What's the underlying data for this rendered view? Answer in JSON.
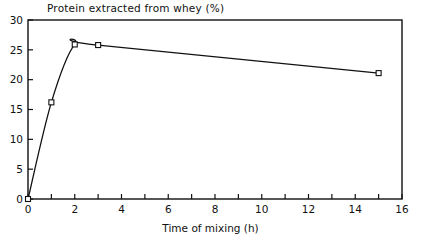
{
  "chart_data": {
    "type": "line",
    "title": "Protein extracted from whey (%)",
    "xlabel": "Time of mixing (h)",
    "ylabel": "Protein extracted from whey (%)",
    "xlim": [
      0,
      16
    ],
    "ylim": [
      0,
      30
    ],
    "grid": false,
    "legend": null,
    "marker": "open-square",
    "x": [
      0,
      1,
      2,
      3,
      15
    ],
    "values": [
      0,
      16.2,
      25.9,
      25.8,
      21.1
    ],
    "series": [
      {
        "name": "Protein extracted from whey (%)",
        "x": [
          0,
          1,
          2,
          3,
          15
        ],
        "values": [
          0,
          16.2,
          25.9,
          25.8,
          21.1
        ]
      }
    ],
    "xticks": [
      0,
      1,
      2,
      3,
      4,
      5,
      6,
      7,
      8,
      9,
      10,
      11,
      12,
      13,
      14,
      15,
      16
    ],
    "xtick_labels": [
      "0",
      "",
      "2",
      "",
      "4",
      "",
      "6",
      "",
      "8",
      "",
      "10",
      "",
      "12",
      "",
      "14",
      "",
      "16"
    ],
    "xtick_labels_shown": [
      "0",
      "2",
      "4",
      "6",
      "8",
      "10",
      "12",
      "14",
      "16"
    ],
    "yticks": [
      0,
      5,
      10,
      15,
      20,
      25,
      30
    ],
    "ytick_labels": [
      "0",
      "5",
      "10",
      "15",
      "20",
      "25",
      "30"
    ],
    "line_color": "#111111",
    "marker_face_color": "#ffffff",
    "marker_edge_color": "#111111"
  },
  "axes": {
    "x_label": "Time of mixing (h)",
    "y_labels": [
      "30",
      "25",
      "20",
      "15",
      "10",
      "5",
      "0"
    ],
    "x_labels": [
      "0",
      "2",
      "4",
      "6",
      "8",
      "10",
      "12",
      "14",
      "16"
    ]
  },
  "colors": {
    "background": "#ffffff",
    "foreground": "#111111",
    "line": "#111111"
  }
}
